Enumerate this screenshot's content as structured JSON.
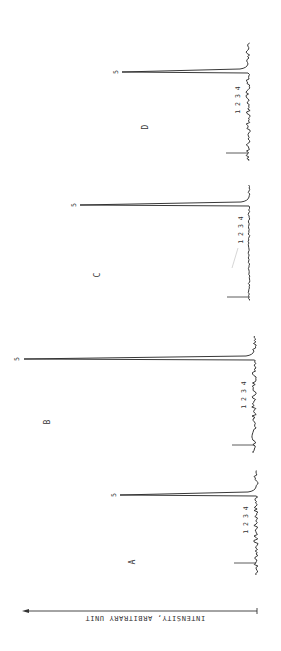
{
  "figure": {
    "orientation": "rotated 90 degrees; intensity axis horizontal, spectra stacked vertically",
    "axis_label": "INTENSITY, ARBITRARY UNIT",
    "panel_labels": [
      "A",
      "B",
      "C",
      "D"
    ],
    "peak_labels": [
      "1",
      "2",
      "3",
      "4",
      "5"
    ]
  },
  "chart_data": {
    "type": "line",
    "title": "",
    "xlabel": "",
    "ylabel": "INTENSITY, ARBITRARY UNIT",
    "grid": false,
    "legend": "none",
    "annotations": [
      "A",
      "B",
      "C",
      "D",
      "1 2 3 4",
      "5"
    ],
    "categories": [
      "1",
      "2",
      "3",
      "4",
      "5"
    ],
    "series": [
      {
        "name": "A",
        "values": [
          2,
          2,
          2,
          2,
          59
        ]
      },
      {
        "name": "B",
        "values": [
          2,
          2,
          2,
          2,
          100
        ]
      },
      {
        "name": "C",
        "values": [
          1,
          1,
          1,
          1,
          73
        ]
      },
      {
        "name": "D",
        "values": [
          2,
          2,
          2,
          2,
          55
        ]
      }
    ],
    "ylim": [
      0,
      100
    ]
  },
  "layout": {
    "spectra": [
      {
        "name": "A",
        "baseline_x": 256,
        "start_y": 575,
        "end_y": 470,
        "ref_tick_y": 563,
        "peak_y": 495,
        "peak_tip_x": 120,
        "label_pos": [
          135,
          562
        ],
        "numbers_pos": [
          248,
          520
        ],
        "five_pos": [
          114,
          495
        ]
      },
      {
        "name": "B",
        "baseline_x": 254,
        "start_y": 452,
        "end_y": 335,
        "ref_tick_y": 445,
        "peak_y": 359,
        "peak_tip_x": 24,
        "label_pos": [
          50,
          422
        ],
        "numbers_pos": [
          246,
          395
        ],
        "five_pos": [
          17,
          359
        ]
      },
      {
        "name": "C",
        "baseline_x": 249,
        "start_y": 300,
        "end_y": 185,
        "ref_tick_y": 297,
        "peak_y": 205,
        "peak_tip_x": 80,
        "label_pos": [
          100,
          275
        ],
        "numbers_pos": [
          243,
          230
        ],
        "five_pos": [
          74,
          205
        ]
      },
      {
        "name": "D",
        "baseline_x": 248,
        "start_y": 160,
        "end_y": 42,
        "ref_tick_y": 153,
        "peak_y": 72,
        "peak_tip_x": 122,
        "label_pos": [
          148,
          127
        ],
        "numbers_pos": [
          240,
          100
        ],
        "five_pos": [
          116,
          72
        ]
      }
    ],
    "axis": {
      "y": 611,
      "x_start": 257,
      "x_end": 22
    }
  }
}
